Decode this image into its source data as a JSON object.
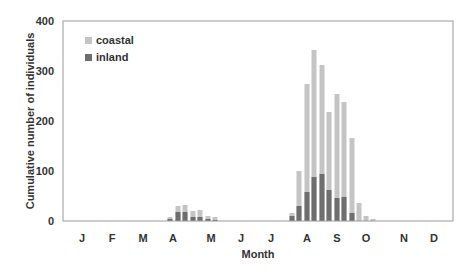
{
  "chart_data": {
    "type": "bar",
    "stacked": false,
    "overlapping": true,
    "title": "",
    "xlabel": "Month",
    "ylabel": "Cumulative number of individuals",
    "ylim": [
      0,
      400
    ],
    "yticks": [
      0,
      100,
      200,
      300,
      400
    ],
    "grid": false,
    "legend_position": "upper-left-inside",
    "months": [
      {
        "label": "J",
        "x": 82
      },
      {
        "label": "F",
        "x": 112
      },
      {
        "label": "M",
        "x": 143
      },
      {
        "label": "A",
        "x": 173
      },
      {
        "label": "M",
        "x": 211
      },
      {
        "label": "J",
        "x": 241
      },
      {
        "label": "J",
        "x": 271
      },
      {
        "label": "A",
        "x": 307
      },
      {
        "label": "S",
        "x": 337
      },
      {
        "label": "O",
        "x": 366
      },
      {
        "label": "N",
        "x": 404
      },
      {
        "label": "D",
        "x": 434
      }
    ],
    "bar_x": [
      170,
      178,
      185,
      193,
      200,
      208,
      215,
      292,
      299,
      307,
      314,
      322,
      329,
      337,
      344,
      352,
      359,
      366,
      373
    ],
    "series": [
      {
        "name": "coastal",
        "color": "#c4c4c4",
        "values": [
          8,
          30,
          32,
          20,
          22,
          10,
          8,
          16,
          100,
          274,
          342,
          312,
          218,
          254,
          238,
          166,
          36,
          10,
          4
        ]
      },
      {
        "name": "inland",
        "color": "#6e6e6e",
        "values": [
          4,
          18,
          18,
          8,
          8,
          4,
          2,
          10,
          30,
          58,
          88,
          94,
          62,
          46,
          48,
          16,
          0,
          0,
          0
        ]
      }
    ]
  }
}
